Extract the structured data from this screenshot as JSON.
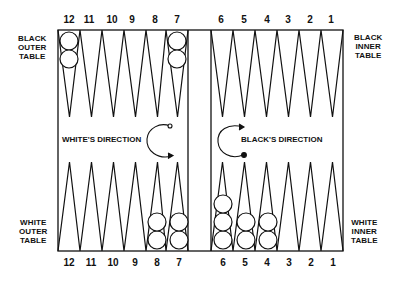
{
  "diagram": {
    "point_numbers_top": [
      "12",
      "11",
      "10",
      "9",
      "8",
      "7",
      "6",
      "5",
      "4",
      "3",
      "2",
      "1"
    ],
    "point_numbers_bottom": [
      "12",
      "11",
      "10",
      "9",
      "8",
      "7",
      "6",
      "5",
      "4",
      "3",
      "2",
      "1"
    ],
    "labels": {
      "top_left": [
        "BLACK",
        "OUTER",
        "TABLE"
      ],
      "top_right": [
        "BLACK",
        "INNER",
        "TABLE"
      ],
      "bottom_left": [
        "WHITE",
        "OUTER",
        "TABLE"
      ],
      "bottom_right": [
        "WHITE",
        "INNER",
        "TABLE"
      ]
    },
    "directions": {
      "white": "WHITE'S DIRECTION",
      "black": "BLACK'S DIRECTION"
    },
    "checkers": {
      "top": [
        {
          "point": "12",
          "count": 2
        },
        {
          "point": "7",
          "count": 2
        }
      ],
      "bottom": [
        {
          "point": "8",
          "count": 2
        },
        {
          "point": "7",
          "count": 2
        },
        {
          "point": "6",
          "count": 3
        },
        {
          "point": "5",
          "count": 2
        },
        {
          "point": "4",
          "count": 2
        }
      ]
    },
    "colors": {
      "line": "#111111",
      "background": "#ffffff"
    }
  }
}
